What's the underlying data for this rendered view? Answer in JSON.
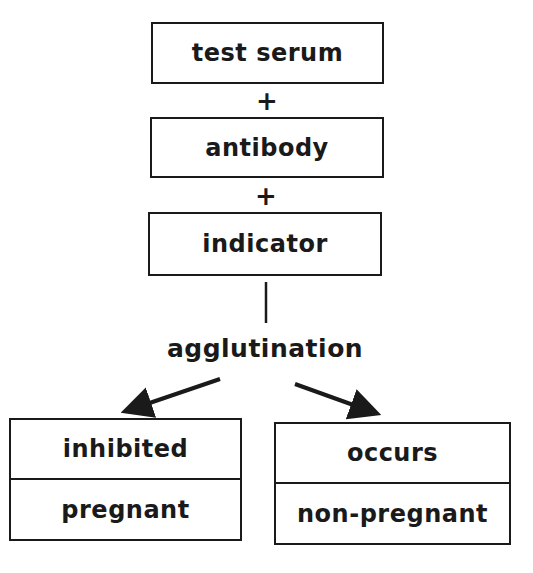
{
  "diagram": {
    "steps": [
      {
        "label": "test serum"
      },
      {
        "label": "antibody"
      },
      {
        "label": "indicator"
      }
    ],
    "operators": [
      "+",
      "+"
    ],
    "reaction": "agglutination",
    "outcomes": [
      {
        "result": "inhibited",
        "interpretation": "pregnant"
      },
      {
        "result": "occurs",
        "interpretation": "non-pregnant"
      }
    ],
    "colors": {
      "stroke": "#1a1a1a",
      "background": "#ffffff"
    }
  }
}
